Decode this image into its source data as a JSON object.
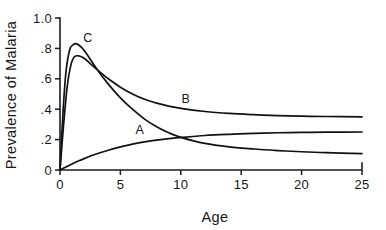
{
  "chart_data": {
    "type": "line",
    "title": "",
    "xlabel": "Age",
    "ylabel": "Prevalence of Malaria",
    "xlim": [
      0,
      25
    ],
    "ylim": [
      0,
      1.0
    ],
    "grid": false,
    "legend_position": "inline-curve-labels",
    "x_ticks": [
      "0",
      "5",
      "10",
      "15",
      "20",
      "25"
    ],
    "x_tick_values": [
      0,
      5,
      10,
      15,
      20,
      25
    ],
    "y_ticks": [
      "0",
      ".2",
      ".4",
      ".6",
      ".8",
      "1.0"
    ],
    "y_tick_values": [
      0,
      0.2,
      0.4,
      0.6,
      0.8,
      1.0
    ],
    "series": [
      {
        "name": "A",
        "label": "A",
        "label_x": 6.6,
        "label_y": 0.235,
        "description": "slow monotonic rise to plateau",
        "x": [
          0,
          0.5,
          1,
          1.5,
          2,
          3,
          4,
          5,
          6,
          7,
          8,
          9,
          10,
          12,
          14,
          16,
          18,
          20,
          22,
          25
        ],
        "values": [
          0,
          0.02,
          0.04,
          0.058,
          0.075,
          0.105,
          0.13,
          0.152,
          0.17,
          0.185,
          0.197,
          0.206,
          0.214,
          0.227,
          0.235,
          0.241,
          0.245,
          0.247,
          0.249,
          0.25
        ]
      },
      {
        "name": "B",
        "label": "B",
        "label_x": 10.4,
        "label_y": 0.44,
        "description": "sharp early peak then decay to high plateau",
        "x": [
          0,
          0.3,
          0.6,
          0.9,
          1.2,
          1.6,
          2,
          2.5,
          3,
          4,
          5,
          6,
          7,
          8,
          9,
          10,
          12,
          14,
          16,
          18,
          20,
          22,
          25
        ],
        "values": [
          0,
          0.3,
          0.55,
          0.69,
          0.745,
          0.75,
          0.735,
          0.7,
          0.665,
          0.6,
          0.545,
          0.5,
          0.465,
          0.44,
          0.42,
          0.405,
          0.385,
          0.372,
          0.364,
          0.358,
          0.354,
          0.352,
          0.35
        ]
      },
      {
        "name": "C",
        "label": "C",
        "label_x": 2.3,
        "label_y": 0.845,
        "description": "highest early peak then decay to low plateau",
        "x": [
          0,
          0.25,
          0.5,
          0.8,
          1.1,
          1.4,
          1.8,
          2.2,
          3,
          4,
          5,
          6,
          7,
          8,
          9,
          10,
          12,
          14,
          16,
          18,
          20,
          22,
          25
        ],
        "values": [
          0,
          0.38,
          0.65,
          0.79,
          0.825,
          0.83,
          0.805,
          0.765,
          0.67,
          0.565,
          0.475,
          0.4,
          0.335,
          0.285,
          0.245,
          0.215,
          0.175,
          0.152,
          0.138,
          0.128,
          0.12,
          0.114,
          0.108
        ]
      }
    ]
  },
  "colors": {
    "curve": "#111111",
    "axis": "#1d1d1d",
    "background": "#ffffff",
    "text": "#161616"
  }
}
